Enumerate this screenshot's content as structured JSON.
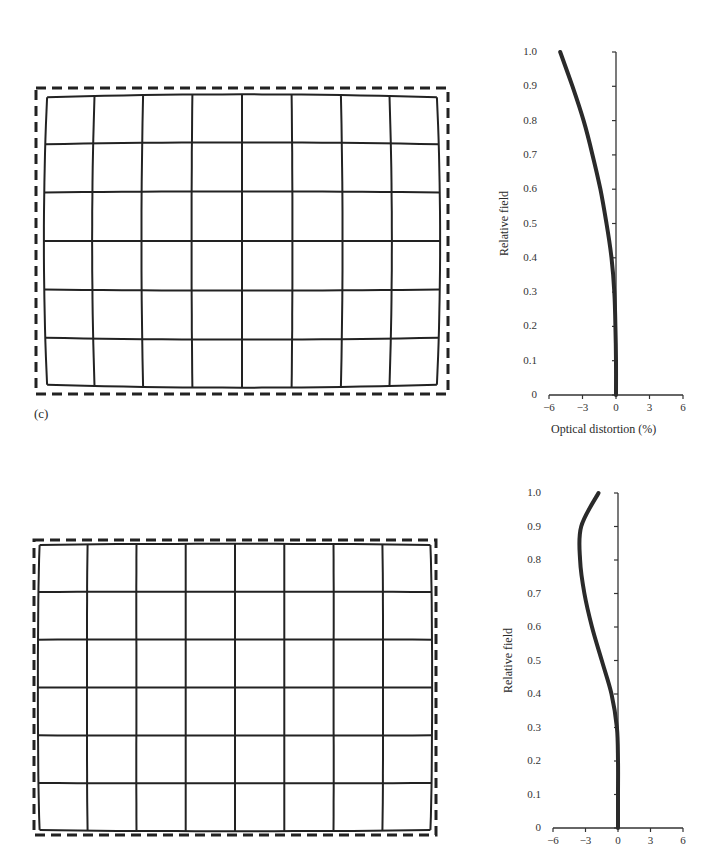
{
  "panel_tag": "(c)",
  "chart_data": [
    {
      "type": "line",
      "title": "",
      "xlabel": "Optical distortion (%)",
      "ylabel": "Relative field",
      "xlim": [
        -6,
        6
      ],
      "ylim": [
        0,
        1.0
      ],
      "x_ticks": [
        "−6",
        "−3",
        "0",
        "3",
        "6"
      ],
      "y_ticks": [
        "0",
        "0.1",
        "0.2",
        "0.3",
        "0.4",
        "0.5",
        "0.6",
        "0.7",
        "0.8",
        "0.9",
        "1.0"
      ],
      "grid": false,
      "series": [
        {
          "name": "barrel distortion",
          "x": [
            0,
            0,
            -0.05,
            -0.15,
            -0.4,
            -0.85,
            -1.4,
            -2.1,
            -2.9,
            -3.9,
            -5.0
          ],
          "y": [
            0,
            0.1,
            0.2,
            0.3,
            0.4,
            0.5,
            0.6,
            0.7,
            0.8,
            0.9,
            1.0
          ]
        }
      ],
      "companion_image": "grid with barrel distortion inside dashed reference rectangle (8 columns × 6 rows)"
    },
    {
      "type": "line",
      "title": "",
      "xlabel": "",
      "ylabel": "Relative field",
      "xlim": [
        -6,
        6
      ],
      "ylim": [
        0,
        1.0
      ],
      "x_ticks": [
        "−6",
        "−3",
        "0",
        "3",
        "6"
      ],
      "y_ticks": [
        "0",
        "0.1",
        "0.2",
        "0.3",
        "0.4",
        "0.5",
        "0.6",
        "0.7",
        "0.8",
        "0.9",
        "1.0"
      ],
      "grid": false,
      "series": [
        {
          "name": "mustache distortion",
          "x": [
            0,
            0,
            0,
            -0.1,
            -0.6,
            -1.5,
            -2.4,
            -3.1,
            -3.5,
            -3.4,
            -1.8
          ],
          "y": [
            0,
            0.1,
            0.2,
            0.3,
            0.4,
            0.5,
            0.6,
            0.7,
            0.8,
            0.9,
            1.0
          ]
        }
      ],
      "companion_image": "grid with mild mustache distortion inside dashed reference rectangle (8 columns × 6 rows)"
    }
  ]
}
